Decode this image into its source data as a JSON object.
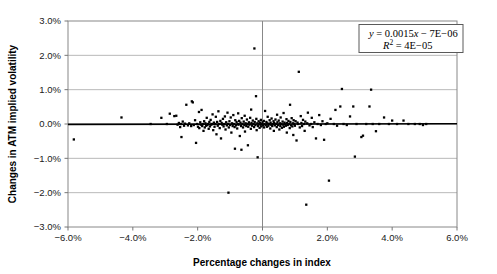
{
  "chart_data": {
    "type": "scatter",
    "title": "",
    "xlabel": "Percentage changes in index",
    "ylabel": "Changes in ATM implied volatility",
    "xlim": [
      -6.0,
      6.0
    ],
    "ylim": [
      -3.0,
      3.0
    ],
    "xticks": [
      "-6.0%",
      "-4.0%",
      "-2.0%",
      "0.0%",
      "2.0%",
      "4.0%",
      "6.0%"
    ],
    "xtick_values": [
      -6.0,
      -4.0,
      -2.0,
      0.0,
      2.0,
      4.0,
      6.0
    ],
    "yticks": [
      "3.0%",
      "2.0%",
      "1.0%",
      "0.0%",
      "-1.0%",
      "-2.0%",
      "-3.0%"
    ],
    "ytick_values": [
      3.0,
      2.0,
      1.0,
      0.0,
      -1.0,
      -2.0,
      -3.0
    ],
    "grid": "horizontal",
    "legend_position": "top-right",
    "annotations": {
      "equation": "y = 0.0015x − 7E−06",
      "r_squared": "R2 = 4E−05",
      "equation_parts": {
        "y": "y",
        "eq": " = 0.0015",
        "x": "x",
        "tail": " − 7E−06"
      },
      "r_squared_parts": {
        "r": "R",
        "sup": "2",
        "tail": " = 4E−05"
      }
    },
    "trendline": {
      "slope": 0.0015,
      "intercept": -7e-06,
      "visible": true,
      "color": "#000000"
    },
    "marker": {
      "shape": "square",
      "color": "#000000",
      "size": 2.3
    },
    "series": [
      {
        "name": "Index vs ATM implied volatility changes",
        "points": [
          [
            -5.82,
            -0.45
          ],
          [
            -4.35,
            0.19
          ],
          [
            -3.45,
            0.0
          ],
          [
            -3.12,
            0.18
          ],
          [
            -2.95,
            0.0
          ],
          [
            -2.86,
            0.3
          ],
          [
            -2.72,
            0.23
          ],
          [
            -2.66,
            0.24
          ],
          [
            -2.62,
            -0.02
          ],
          [
            -2.58,
            0.03
          ],
          [
            -2.54,
            -0.09
          ],
          [
            -2.52,
            0.0
          ],
          [
            -2.5,
            -0.38
          ],
          [
            -2.46,
            0.07
          ],
          [
            -2.42,
            -0.05
          ],
          [
            -2.39,
            0.01
          ],
          [
            -2.35,
            0.56
          ],
          [
            -2.3,
            -0.04
          ],
          [
            -2.26,
            0.02
          ],
          [
            -2.2,
            -0.06
          ],
          [
            -2.18,
            0.66
          ],
          [
            -2.15,
            0.63
          ],
          [
            -2.12,
            -0.03
          ],
          [
            -2.08,
            0.11
          ],
          [
            -2.05,
            -0.55
          ],
          [
            -2.02,
            0.0
          ],
          [
            -1.99,
            -0.08
          ],
          [
            -1.96,
            0.35
          ],
          [
            -1.95,
            -0.12
          ],
          [
            -1.92,
            0.05
          ],
          [
            -1.9,
            -0.02
          ],
          [
            -1.88,
            0.41
          ],
          [
            -1.86,
            -0.06
          ],
          [
            -1.84,
            0.0
          ],
          [
            -1.82,
            -0.2
          ],
          [
            -1.8,
            0.08
          ],
          [
            -1.78,
            -0.1
          ],
          [
            -1.76,
            0.02
          ],
          [
            -1.74,
            -0.05
          ],
          [
            -1.72,
            0.18
          ],
          [
            -1.7,
            -0.03
          ],
          [
            -1.68,
            0.0
          ],
          [
            -1.66,
            -0.14
          ],
          [
            -1.64,
            0.06
          ],
          [
            -1.62,
            -0.07
          ],
          [
            -1.6,
            0.12
          ],
          [
            -1.58,
            -0.02
          ],
          [
            -1.56,
            0.0
          ],
          [
            -1.54,
            0.28
          ],
          [
            -1.52,
            -0.18
          ],
          [
            -1.5,
            0.04
          ],
          [
            -1.48,
            -0.08
          ],
          [
            -1.46,
            0.0
          ],
          [
            -1.44,
            0.21
          ],
          [
            -1.42,
            -0.3
          ],
          [
            -1.4,
            0.06
          ],
          [
            -1.38,
            -0.05
          ],
          [
            -1.36,
            0.37
          ],
          [
            -1.34,
            0.0
          ],
          [
            -1.32,
            -0.12
          ],
          [
            -1.3,
            0.09
          ],
          [
            -1.28,
            -0.42
          ],
          [
            -1.26,
            0.03
          ],
          [
            -1.24,
            -0.02
          ],
          [
            -1.22,
            0.15
          ],
          [
            -1.2,
            -0.07
          ],
          [
            -1.18,
            0.0
          ],
          [
            -1.16,
            0.22
          ],
          [
            -1.14,
            -0.16
          ],
          [
            -1.12,
            0.05
          ],
          [
            -1.1,
            -0.04
          ],
          [
            -1.08,
            0.33
          ],
          [
            -1.06,
            0.0
          ],
          [
            -1.05,
            -2.0
          ],
          [
            -1.04,
            -0.1
          ],
          [
            -1.02,
            0.08
          ],
          [
            -1.0,
            -0.03
          ],
          [
            -0.98,
            0.19
          ],
          [
            -0.96,
            -0.25
          ],
          [
            -0.94,
            0.02
          ],
          [
            -0.92,
            -0.06
          ],
          [
            -0.9,
            0.26
          ],
          [
            -0.88,
            0.0
          ],
          [
            -0.86,
            -0.09
          ],
          [
            -0.85,
            -0.72
          ],
          [
            -0.84,
            0.11
          ],
          [
            -0.82,
            -0.04
          ],
          [
            -0.8,
            0.06
          ],
          [
            -0.78,
            -0.13
          ],
          [
            -0.76,
            0.0
          ],
          [
            -0.75,
            0.31
          ],
          [
            -0.74,
            -0.02
          ],
          [
            -0.72,
            0.09
          ],
          [
            -0.7,
            -0.35
          ],
          [
            -0.68,
            0.04
          ],
          [
            -0.66,
            -0.06
          ],
          [
            -0.65,
            -0.75
          ],
          [
            -0.64,
            0.17
          ],
          [
            -0.62,
            0.0
          ],
          [
            -0.6,
            -0.1
          ],
          [
            -0.58,
            0.07
          ],
          [
            -0.56,
            -0.03
          ],
          [
            -0.55,
            0.24
          ],
          [
            -0.54,
            -0.22
          ],
          [
            -0.52,
            0.02
          ],
          [
            -0.5,
            -0.06
          ],
          [
            -0.48,
            0.13
          ],
          [
            -0.46,
            0.0
          ],
          [
            -0.45,
            -0.62
          ],
          [
            -0.44,
            -0.08
          ],
          [
            -0.42,
            0.05
          ],
          [
            -0.4,
            -0.02
          ],
          [
            -0.38,
            0.18
          ],
          [
            -0.36,
            -0.14
          ],
          [
            -0.35,
            0.42
          ],
          [
            -0.34,
            0.03
          ],
          [
            -0.32,
            -0.05
          ],
          [
            -0.3,
            0.1
          ],
          [
            -0.28,
            0.0
          ],
          [
            -0.26,
            -0.09
          ],
          [
            -0.25,
            2.2
          ],
          [
            -0.24,
            0.06
          ],
          [
            -0.22,
            -0.03
          ],
          [
            -0.2,
            0.81
          ],
          [
            -0.19,
            0.15
          ],
          [
            -0.18,
            -0.18
          ],
          [
            -0.16,
            0.02
          ],
          [
            -0.15,
            -0.97
          ],
          [
            -0.14,
            -0.06
          ],
          [
            -0.12,
            0.08
          ],
          [
            -0.1,
            0.0
          ],
          [
            -0.09,
            -0.11
          ],
          [
            -0.08,
            0.04
          ],
          [
            -0.06,
            -0.02
          ],
          [
            -0.05,
            0.12
          ],
          [
            -0.04,
            -0.07
          ],
          [
            -0.02,
            0.0
          ],
          [
            0.0,
            0.05
          ],
          [
            0.02,
            -0.04
          ],
          [
            0.04,
            0.09
          ],
          [
            0.05,
            -0.1
          ],
          [
            0.06,
            0.0
          ],
          [
            0.08,
            0.38
          ],
          [
            0.1,
            -0.03
          ],
          [
            0.12,
            0.06
          ],
          [
            0.14,
            -0.08
          ],
          [
            0.15,
            0.02
          ],
          [
            0.16,
            0.21
          ],
          [
            0.18,
            -0.05
          ],
          [
            0.2,
            0.0
          ],
          [
            0.22,
            0.11
          ],
          [
            0.24,
            -0.13
          ],
          [
            0.25,
            0.04
          ],
          [
            0.26,
            -0.02
          ],
          [
            0.28,
            0.16
          ],
          [
            0.3,
            -0.06
          ],
          [
            0.32,
            0.0
          ],
          [
            0.34,
            0.08
          ],
          [
            0.35,
            -0.2
          ],
          [
            0.36,
            0.03
          ],
          [
            0.38,
            -0.04
          ],
          [
            0.4,
            0.13
          ],
          [
            0.42,
            0.0
          ],
          [
            0.44,
            -0.09
          ],
          [
            0.45,
            0.27
          ],
          [
            0.46,
            0.05
          ],
          [
            0.48,
            -0.03
          ],
          [
            0.5,
            0.1
          ],
          [
            0.52,
            -0.16
          ],
          [
            0.54,
            0.02
          ],
          [
            0.55,
            -0.06
          ],
          [
            0.56,
            0.19
          ],
          [
            0.58,
            0.0
          ],
          [
            0.6,
            -0.11
          ],
          [
            0.62,
            0.07
          ],
          [
            0.64,
            -0.02
          ],
          [
            0.65,
            0.32
          ],
          [
            0.66,
            -0.08
          ],
          [
            0.68,
            0.04
          ],
          [
            0.7,
            0.0
          ],
          [
            0.72,
            -0.05
          ],
          [
            0.74,
            0.14
          ],
          [
            0.75,
            -0.25
          ],
          [
            0.76,
            0.03
          ],
          [
            0.78,
            -0.03
          ],
          [
            0.8,
            0.09
          ],
          [
            0.82,
            0.0
          ],
          [
            0.84,
            -0.12
          ],
          [
            0.85,
            0.56
          ],
          [
            0.86,
            0.06
          ],
          [
            0.88,
            -0.04
          ],
          [
            0.9,
            0.17
          ],
          [
            0.92,
            -0.07
          ],
          [
            0.94,
            0.02
          ],
          [
            0.95,
            -0.32
          ],
          [
            0.96,
            0.11
          ],
          [
            0.98,
            0.0
          ],
          [
            1.0,
            -0.05
          ],
          [
            1.02,
            0.08
          ],
          [
            1.05,
            -0.48
          ],
          [
            1.08,
            0.04
          ],
          [
            1.1,
            0.0
          ],
          [
            1.12,
            1.52
          ],
          [
            1.15,
            -0.1
          ],
          [
            1.18,
            0.23
          ],
          [
            1.2,
            0.03
          ],
          [
            1.22,
            -0.06
          ],
          [
            1.25,
            0.12
          ],
          [
            1.28,
            0.0
          ],
          [
            1.3,
            -0.2
          ],
          [
            1.32,
            0.07
          ],
          [
            1.35,
            -2.35
          ],
          [
            1.38,
            0.02
          ],
          [
            1.4,
            0.33
          ],
          [
            1.45,
            -0.04
          ],
          [
            1.5,
            0.0
          ],
          [
            1.52,
            0.18
          ],
          [
            1.55,
            -0.09
          ],
          [
            1.6,
            0.05
          ],
          [
            1.65,
            -0.42
          ],
          [
            1.7,
            0.0
          ],
          [
            1.75,
            0.26
          ],
          [
            1.8,
            -0.03
          ],
          [
            1.85,
            0.08
          ],
          [
            1.9,
            -0.46
          ],
          [
            1.95,
            0.0
          ],
          [
            2.0,
            0.02
          ],
          [
            2.05,
            -1.65
          ],
          [
            2.1,
            0.15
          ],
          [
            2.2,
            0.0
          ],
          [
            2.25,
            0.41
          ],
          [
            2.3,
            -0.05
          ],
          [
            2.4,
            0.51
          ],
          [
            2.45,
            1.02
          ],
          [
            2.5,
            0.0
          ],
          [
            2.6,
            -0.03
          ],
          [
            2.7,
            0.22
          ],
          [
            2.8,
            0.51
          ],
          [
            2.85,
            -0.95
          ],
          [
            2.9,
            0.0
          ],
          [
            3.05,
            -0.38
          ],
          [
            3.1,
            -0.34
          ],
          [
            3.2,
            0.0
          ],
          [
            3.3,
            0.51
          ],
          [
            3.35,
            1.0
          ],
          [
            3.4,
            0.0
          ],
          [
            3.5,
            -0.21
          ],
          [
            3.6,
            0.0
          ],
          [
            3.75,
            0.19
          ],
          [
            3.9,
            0.0
          ],
          [
            4.0,
            0.1
          ],
          [
            4.15,
            0.0
          ],
          [
            4.35,
            0.1
          ],
          [
            4.5,
            0.0
          ],
          [
            4.7,
            0.0
          ],
          [
            4.85,
            0.0
          ],
          [
            4.95,
            -0.03
          ],
          [
            5.05,
            0.0
          ]
        ]
      }
    ]
  }
}
